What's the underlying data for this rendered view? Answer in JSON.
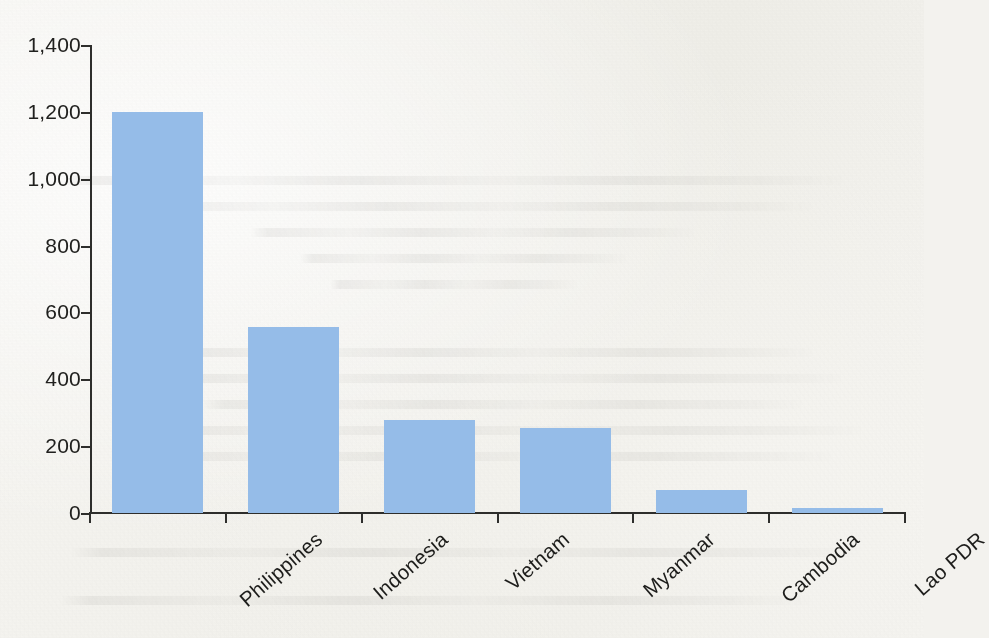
{
  "chart_data": {
    "type": "bar",
    "title": "",
    "subtitle": "",
    "xlabel": "",
    "ylabel": "",
    "categories": [
      "Philippines",
      "Indonesia",
      "Vietnam",
      "Myanmar",
      "Cambodia",
      "Lao PDR"
    ],
    "values": [
      1200,
      556,
      278,
      254,
      69,
      15
    ],
    "ylim": [
      0,
      1400
    ],
    "ytick_values": [
      0,
      200,
      400,
      600,
      800,
      1000,
      1200,
      1400
    ],
    "ytick_labels": [
      "0",
      "200",
      "400",
      "600",
      "800",
      "1,000",
      "1,200",
      "1,400"
    ],
    "grid": false,
    "legend": false,
    "legend_position": "none",
    "bar_color": "#95bce8",
    "axis_color": "#2e2e2c",
    "background_color": "#f3f2ee",
    "xtick_label_rotation": -41
  }
}
